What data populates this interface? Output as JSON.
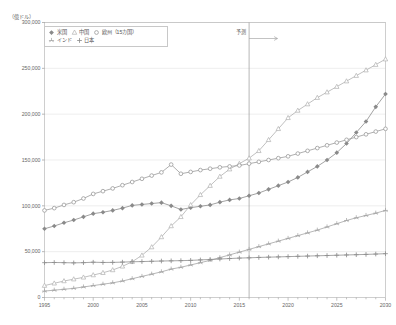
{
  "unit_label": "（億ドル）",
  "annotation": {
    "forecast_label": "予測",
    "forecast_year": 2016
  },
  "legend": {
    "rows": [
      [
        {
          "label": "米国",
          "key": "us",
          "color": "#8a8a8a",
          "marker": "diamond"
        },
        {
          "label": "中国",
          "key": "china",
          "color": "#b0b0b0",
          "marker": "triangle"
        },
        {
          "label": "欧州（15カ国）",
          "key": "europe",
          "color": "#9a9a9a",
          "marker": "circle"
        }
      ],
      [
        {
          "label": "インド",
          "key": "india",
          "color": "#a5a5a5",
          "marker": "star"
        },
        {
          "label": "日本",
          "key": "japan",
          "color": "#8f8f8f",
          "marker": "plus"
        }
      ]
    ]
  },
  "chart_data": {
    "type": "line",
    "title": "",
    "subtitle": "",
    "xlabel": "",
    "ylabel": "（億ドル）",
    "xlim": [
      1995,
      2030
    ],
    "ylim": [
      0,
      300000
    ],
    "ytick_step": 50000,
    "ytick_labels": [
      "0",
      "50,000",
      "100,000",
      "150,000",
      "200,000",
      "250,000",
      "300,000"
    ],
    "yticks": [
      0,
      50000,
      100000,
      150000,
      200000,
      250000,
      300000
    ],
    "xtick_labels": [
      "1995",
      "2000",
      "2005",
      "2010",
      "2015",
      "2020",
      "2025",
      "2030"
    ],
    "xticks": [
      1995,
      2000,
      2005,
      2010,
      2015,
      2020,
      2025,
      2030
    ],
    "xtick_minor_step": 1,
    "grid": "horizontal",
    "legend_position": "top-left",
    "annotations": [
      {
        "text": "予測",
        "x": 2016,
        "type": "vline-with-arrow"
      }
    ],
    "x": [
      1995,
      1996,
      1997,
      1998,
      1999,
      2000,
      2001,
      2002,
      2003,
      2004,
      2005,
      2006,
      2007,
      2008,
      2009,
      2010,
      2011,
      2012,
      2013,
      2014,
      2015,
      2016,
      2017,
      2018,
      2019,
      2020,
      2021,
      2022,
      2023,
      2024,
      2025,
      2026,
      2027,
      2028,
      2029,
      2030
    ],
    "series": [
      {
        "name": "米国",
        "key": "us",
        "color": "#8a8a8a",
        "marker": "diamond",
        "values": [
          75000,
          78000,
          81500,
          84500,
          88000,
          91500,
          93000,
          95000,
          97500,
          100500,
          101500,
          102500,
          103500,
          100000,
          96000,
          98000,
          99500,
          101000,
          104000,
          106500,
          108000,
          111000,
          114000,
          118000,
          122000,
          126000,
          131000,
          137000,
          143000,
          150000,
          158000,
          168000,
          180000,
          192000,
          208000,
          222000
        ]
      },
      {
        "name": "中国",
        "key": "china",
        "color": "#b0b0b0",
        "marker": "triangle",
        "values": [
          13000,
          15500,
          18000,
          20000,
          22000,
          24500,
          27000,
          30000,
          34000,
          39000,
          46000,
          55000,
          66000,
          78000,
          88000,
          101000,
          112000,
          122000,
          132000,
          140000,
          146000,
          152000,
          160000,
          172000,
          184000,
          196000,
          204000,
          211000,
          218000,
          224000,
          230000,
          236000,
          242000,
          248000,
          254000,
          260000
        ]
      },
      {
        "name": "欧州（15カ国）",
        "key": "europe",
        "color": "#9a9a9a",
        "marker": "circle",
        "values": [
          95000,
          97500,
          101000,
          104000,
          108000,
          113000,
          116000,
          119000,
          122500,
          126000,
          129500,
          133000,
          136500,
          145000,
          135000,
          137000,
          139000,
          140500,
          142000,
          143000,
          144000,
          146000,
          148000,
          150000,
          152000,
          154000,
          157000,
          160000,
          163000,
          166000,
          169000,
          172000,
          175000,
          178000,
          181000,
          184000
        ]
      },
      {
        "name": "インド",
        "key": "india",
        "color": "#a5a5a5",
        "marker": "star",
        "values": [
          7000,
          8000,
          9000,
          10000,
          11500,
          13000,
          14500,
          16000,
          18000,
          20500,
          23000,
          25500,
          28000,
          31000,
          33000,
          35500,
          38000,
          40500,
          43500,
          46500,
          49500,
          52500,
          55500,
          58500,
          61500,
          64500,
          67500,
          70500,
          73500,
          77000,
          80500,
          84000,
          87000,
          89500,
          92000,
          95000
        ]
      },
      {
        "name": "日本",
        "key": "japan",
        "color": "#8f8f8f",
        "marker": "plus",
        "values": [
          38000,
          38200,
          38000,
          37800,
          38000,
          38500,
          38200,
          38300,
          38600,
          39000,
          39200,
          39500,
          39800,
          40000,
          40200,
          40500,
          41000,
          41500,
          42000,
          42500,
          43000,
          43300,
          43700,
          44000,
          44300,
          44600,
          44900,
          45200,
          45500,
          45800,
          46100,
          46400,
          46700,
          47000,
          47400,
          47800
        ]
      }
    ]
  }
}
